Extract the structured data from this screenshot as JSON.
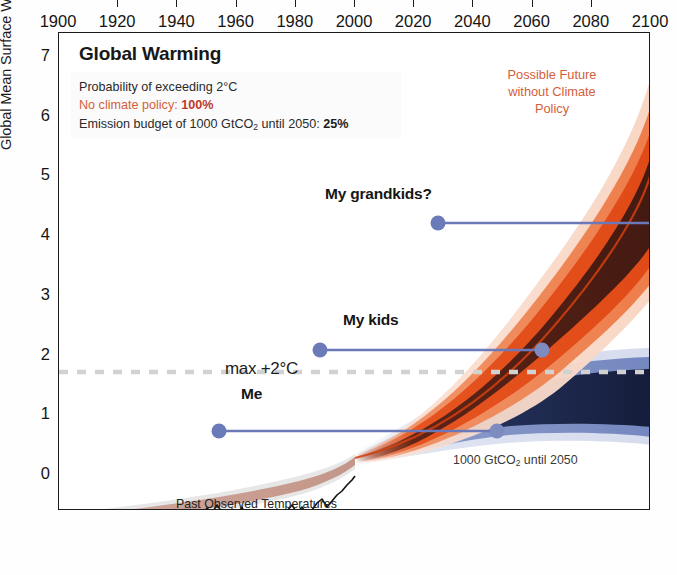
{
  "header": {
    "title": "Global Warming",
    "legend": {
      "line1": "Probability of exceeding 2°C",
      "line2_label": "No climate policy:",
      "line2_value": "100%",
      "line3_label_a": "Emission budget of 1000 GtCO",
      "line3_sub": "2",
      "line3_label_b": " until 2050:",
      "line3_value": "25%"
    }
  },
  "annotations": {
    "future_no_policy": "Possible Future without Climate Policy",
    "future_no_policy_l1": "Possible Future",
    "future_no_policy_l2": "without Climate",
    "future_no_policy_l3": "Policy",
    "grandkids": "My grandkids?",
    "kids": "My kids",
    "me": "Me",
    "max2c": "max +2°C",
    "budget_plume_a": "1000 GtCO",
    "budget_plume_sub": "2",
    "budget_plume_b": " until 2050",
    "past_observed": "Past Observed Temperatures",
    "source": "Source: Adapted from Meinshausen et al. (2009)"
  },
  "colors": {
    "orange_accent": "#d4603a",
    "orange_bright": "#e8541f",
    "orange_dark_core": "#4a1d14",
    "blue_plume": "#2b3a70",
    "lifespan_blue": "#6b79b8",
    "dash_gray": "#d2d2d2",
    "axis_black": "#1b1b1b"
  },
  "chart_data": {
    "type": "area",
    "title": "Global Warming",
    "xlabel": "",
    "ylabel": "Global Mean Surface Warming (°C)",
    "xlim": [
      1900,
      2100
    ],
    "ylim": [
      -0.6,
      7.4
    ],
    "grid": false,
    "legend_position": "top-left",
    "xticks": [
      1900,
      1920,
      1940,
      1960,
      1980,
      2000,
      2020,
      2040,
      2060,
      2080,
      2100
    ],
    "yticks": [
      0,
      1,
      2,
      3,
      4,
      5,
      6,
      7
    ],
    "yticks_minor": [
      0.5,
      1.5,
      2.5,
      3.5,
      4.5,
      5.5,
      6.5
    ],
    "reference_line": {
      "label": "max +2°C",
      "value": 2.0,
      "style": "dashed",
      "color": "#d2d2d2"
    },
    "series": [
      {
        "name": "Past Observed Temperatures",
        "type": "line",
        "color": "#111111",
        "x": [
          1900,
          1905,
          1910,
          1915,
          1920,
          1925,
          1930,
          1935,
          1940,
          1945,
          1950,
          1955,
          1960,
          1965,
          1970,
          1975,
          1980,
          1985,
          1990,
          1995,
          2000,
          2005,
          2009
        ],
        "values": [
          -0.15,
          -0.3,
          -0.4,
          -0.25,
          -0.22,
          -0.18,
          -0.1,
          -0.12,
          0.08,
          0.05,
          -0.08,
          -0.1,
          -0.02,
          -0.12,
          0.02,
          -0.05,
          0.15,
          0.1,
          0.28,
          0.3,
          0.4,
          0.52,
          0.58
        ]
      },
      {
        "name": "No climate policy (median)",
        "type": "line",
        "color": "#d4400f",
        "x": [
          2000,
          2010,
          2020,
          2030,
          2040,
          2050,
          2060,
          2070,
          2080,
          2090,
          2100
        ],
        "values": [
          0.45,
          0.75,
          1.1,
          1.55,
          2.1,
          2.75,
          3.4,
          4.1,
          4.75,
          5.3,
          5.75
        ]
      },
      {
        "name": "No climate policy (uncertainty range)",
        "type": "band",
        "color": "#e8541f",
        "x": [
          2000,
          2020,
          2040,
          2060,
          2080,
          2100
        ],
        "low": [
          0.4,
          0.95,
          1.65,
          2.45,
          3.2,
          3.8
        ],
        "high": [
          0.52,
          1.35,
          2.75,
          4.35,
          5.95,
          7.3
        ]
      },
      {
        "name": "1000 GtCO2 until 2050 (median)",
        "type": "line",
        "color": "#2b3a70",
        "x": [
          2000,
          2020,
          2040,
          2060,
          2080,
          2100
        ],
        "values": [
          0.45,
          1.05,
          1.55,
          1.75,
          1.8,
          1.78
        ]
      },
      {
        "name": "1000 GtCO2 until 2050 (uncertainty range)",
        "type": "band",
        "color": "#3c4d85",
        "x": [
          2000,
          2020,
          2040,
          2060,
          2080,
          2100
        ],
        "low": [
          0.4,
          0.85,
          1.2,
          1.32,
          1.34,
          1.32
        ],
        "high": [
          0.52,
          1.35,
          2.05,
          2.28,
          2.32,
          2.3
        ]
      }
    ],
    "lifespans": [
      {
        "label": "Me",
        "start_year": 1966,
        "end_year": 2046,
        "y": 1.25
      },
      {
        "label": "My kids",
        "start_year": 2000,
        "end_year": 2075,
        "y": 2.47
      },
      {
        "label": "My grandkids?",
        "start_year": 2040,
        "end_year": 2100,
        "y": 4.33
      }
    ]
  }
}
